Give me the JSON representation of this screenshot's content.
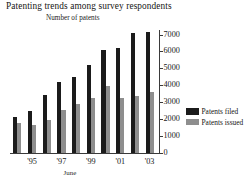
{
  "chart_data": {
    "type": "bar",
    "title": "Patenting trends among survey respondents",
    "ylabel": "Number of patents",
    "xlabel": "June",
    "categories": [
      "'94",
      "'95",
      "'96",
      "'97",
      "'98",
      "'99",
      "'00",
      "'01",
      "'02",
      "'03"
    ],
    "xtick_labels": [
      "'95",
      "'97",
      "'99",
      "'01",
      "'03"
    ],
    "xtick_categories": [
      "'95",
      "'97",
      "'99",
      "'01",
      "'03"
    ],
    "ytick_labels": [
      "0",
      "1000",
      "2000",
      "3000",
      "4000",
      "5000",
      "6000",
      "7000"
    ],
    "ytick_values": [
      0,
      1000,
      2000,
      3000,
      4000,
      5000,
      6000,
      7000
    ],
    "ylim": [
      0,
      7300
    ],
    "grid": false,
    "legend_position": "right",
    "series": [
      {
        "name": "Patents filed",
        "color": "#1b1b1b",
        "values": [
          2150,
          2500,
          3450,
          4200,
          4500,
          5200,
          6100,
          6250,
          7150,
          7200
        ]
      },
      {
        "name": "Patents issued",
        "color": "#8e8e8e",
        "values": [
          1800,
          1650,
          1950,
          2550,
          2900,
          3250,
          4000,
          3250,
          3400,
          3650
        ]
      }
    ]
  },
  "legend": {
    "items": [
      {
        "label": "Patents filed",
        "color": "#1b1b1b"
      },
      {
        "label": "Patents issued",
        "color": "#8e8e8e"
      }
    ]
  }
}
